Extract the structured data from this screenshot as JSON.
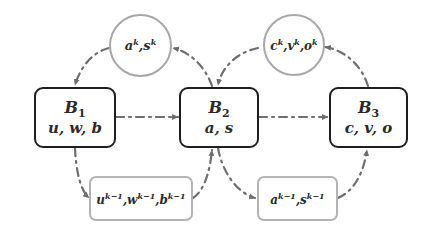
{
  "diagram": {
    "colors": {
      "block_border": "#1e1e1e",
      "state_border": "#a8a8a8",
      "arrow": "#6e6e6e",
      "text": "#2a2a2a"
    },
    "blocks": [
      {
        "id": "B1",
        "title": "B",
        "subscript": "1",
        "vars": "u, w, b"
      },
      {
        "id": "B2",
        "title": "B",
        "subscript": "2",
        "vars": "a, s"
      },
      {
        "id": "B3",
        "title": "B",
        "subscript": "3",
        "vars": "c, v, o"
      }
    ],
    "current_states": [
      {
        "id": "state-k-1",
        "parts": [
          {
            "base": "a",
            "sup": "k"
          },
          {
            "base": "s",
            "sup": "k"
          }
        ]
      },
      {
        "id": "state-k-2",
        "parts": [
          {
            "base": "c",
            "sup": "k"
          },
          {
            "base": "v",
            "sup": "k"
          },
          {
            "base": "o",
            "sup": "k"
          }
        ]
      }
    ],
    "previous_states": [
      {
        "id": "state-km1-1",
        "parts": [
          {
            "base": "u",
            "sup": "k−1"
          },
          {
            "base": "w",
            "sup": "k−1"
          },
          {
            "base": "b",
            "sup": "k−1"
          }
        ]
      },
      {
        "id": "state-km1-2",
        "parts": [
          {
            "base": "a",
            "sup": "k−1"
          },
          {
            "base": "s",
            "sup": "k−1"
          }
        ]
      }
    ],
    "separator": ","
  }
}
